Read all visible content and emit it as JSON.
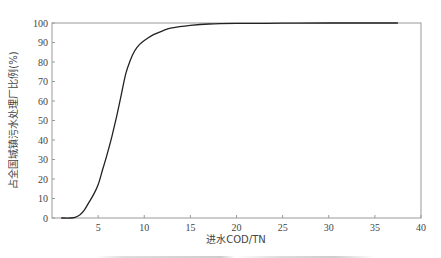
{
  "chart_data": {
    "type": "line",
    "title": "",
    "xlabel": "进水COD/TN",
    "ylabel": "占全国城镇污水处理厂比例(%)",
    "xlim": [
      0,
      40
    ],
    "ylim": [
      0,
      100
    ],
    "xticks": [
      5,
      10,
      15,
      20,
      25,
      30,
      35,
      40
    ],
    "yticks": [
      0,
      10,
      20,
      30,
      40,
      50,
      60,
      70,
      80,
      90,
      100
    ],
    "grid": false,
    "legend": null,
    "series": [
      {
        "name": "cumulative",
        "x": [
          1.0,
          2.0,
          2.5,
          3.0,
          3.5,
          4.0,
          4.5,
          5.0,
          5.5,
          6.0,
          6.5,
          7.0,
          7.5,
          8.0,
          8.5,
          9.0,
          9.5,
          10.0,
          11.0,
          12.0,
          13.0,
          15.0,
          17.0,
          20.0,
          25.0,
          30.0,
          37.5
        ],
        "y": [
          0,
          0,
          0.3,
          1.5,
          4,
          8,
          12,
          17,
          25,
          33,
          42,
          52,
          63,
          74,
          81,
          86,
          89,
          91,
          94,
          96,
          97.5,
          98.8,
          99.5,
          99.8,
          99.9,
          100,
          100
        ]
      }
    ]
  },
  "labels": {
    "x_axis": "进水COD/TN",
    "y_axis": "占全国城镇污水处理厂比例(%)"
  }
}
